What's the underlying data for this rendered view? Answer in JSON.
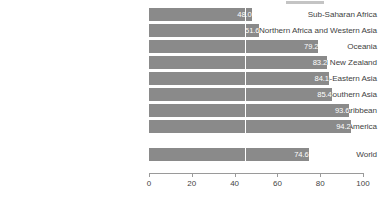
{
  "chart_data": {
    "type": "bar",
    "orientation": "horizontal",
    "title": "",
    "xlabel": "",
    "ylabel": "",
    "xlim": [
      0,
      100
    ],
    "grid": true,
    "gridline_value": 45,
    "legend": "none",
    "bar_color": "#8a8a8a",
    "value_label_color": "#ffffff",
    "axis_color": "#9a9a9a",
    "tick_label_color": "#444444",
    "categories": [
      "Sub-Saharan Africa",
      "Northern Africa and Western Asia",
      "Oceania",
      "Australia and New Zealand",
      "Eastern and South-Eastern Asia",
      "Central and Southern Asia",
      "Latin America and the Caribbean",
      "Europe and Northern America"
    ],
    "values": [
      48.0,
      51.6,
      79.2,
      83.2,
      84.1,
      85.4,
      93.6,
      94.2
    ],
    "value_labels": [
      "48.0",
      "51.6",
      "79.2",
      "83.2",
      "84.1",
      "85.4",
      "93.6",
      "94.2"
    ],
    "aggregate": {
      "category": "World",
      "value": 74.6,
      "value_label": "74.6"
    },
    "xticks": [
      0,
      20,
      40,
      60,
      80,
      100
    ],
    "xtick_labels": [
      "0",
      "20",
      "40",
      "60",
      "80",
      "100"
    ]
  },
  "rows": [
    {
      "label": "Sub-Saharan Africa",
      "value": 48.0,
      "value_label": "48.0",
      "top": 8
    },
    {
      "label": "Northern Africa and Western Asia",
      "value": 51.6,
      "value_label": "51.6",
      "top": 24
    },
    {
      "label": "Oceania",
      "value": 79.2,
      "value_label": "79.2",
      "top": 40
    },
    {
      "label": "Australia and New Zealand",
      "value": 83.2,
      "value_label": "83.2",
      "top": 56
    },
    {
      "label": "Eastern and South-Eastern Asia",
      "value": 84.1,
      "value_label": "84.1",
      "top": 72
    },
    {
      "label": "Central and Southern Asia",
      "value": 85.4,
      "value_label": "85.4",
      "top": 88
    },
    {
      "label": "Latin America and the Caribbean",
      "value": 93.6,
      "value_label": "93.6",
      "top": 104
    },
    {
      "label": "Europe and Northern America",
      "value": 94.2,
      "value_label": "94.2",
      "top": 120
    },
    {
      "label": "World",
      "value": 74.6,
      "value_label": "74.6",
      "top": 148
    }
  ],
  "xaxis": {
    "ticks": [
      {
        "label": "0",
        "value": 0
      },
      {
        "label": "20",
        "value": 20
      },
      {
        "label": "40",
        "value": 40
      },
      {
        "label": "60",
        "value": 60
      },
      {
        "label": "80",
        "value": 80
      },
      {
        "label": "100",
        "value": 100
      }
    ]
  }
}
